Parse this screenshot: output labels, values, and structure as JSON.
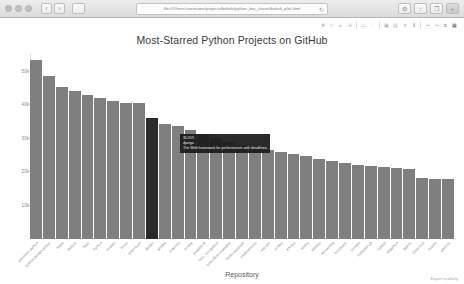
{
  "browser": {
    "url": "file:///Users/username/projects/bokeh/python_bar_charts/bokeh_plot.html",
    "reload_icon": "reload-icon",
    "back_icon": "‹",
    "forward_icon": "›",
    "sidebar_icon": "sidebar-icon",
    "settings_icon": "⚙",
    "share_icon": "↑",
    "tabs_icon": "❐",
    "newtab_icon": "+"
  },
  "toolbar": {
    "tools": [
      {
        "name": "pan-tool",
        "glyph": "✥"
      },
      {
        "name": "boxzoom-tool",
        "glyph": "□"
      },
      {
        "name": "wheelzoom-tool",
        "glyph": "⌕"
      },
      {
        "name": "crosshair-tool",
        "glyph": "✛"
      },
      {
        "name": "sep1",
        "glyph": "|"
      },
      {
        "name": "boxselect-tool",
        "glyph": "▭"
      },
      {
        "name": "lassoselect-tool",
        "glyph": "◌"
      },
      {
        "name": "sep2",
        "glyph": "|"
      },
      {
        "name": "tap-tool",
        "glyph": "▣"
      },
      {
        "name": "hover-tool",
        "glyph": "▤"
      },
      {
        "name": "reset-tool",
        "glyph": "✕"
      },
      {
        "name": "save-tool",
        "glyph": "⬇"
      },
      {
        "name": "sep3",
        "glyph": "|"
      },
      {
        "name": "undo-tool",
        "glyph": "↩"
      },
      {
        "name": "redo-tool",
        "glyph": "↪"
      },
      {
        "name": "menu-tool",
        "glyph": "≡"
      },
      {
        "name": "help-tool",
        "glyph": "▦"
      }
    ]
  },
  "export_label": "Export to plot.ly",
  "tooltip": {
    "visible": true,
    "stars": "35,919",
    "repository": "django",
    "description": "The Web framework for perfectionists with deadlines."
  },
  "chart_data": {
    "type": "bar",
    "title": "Most-Starred Python Projects on GitHub",
    "xlabel": "Repository",
    "ylabel": "Stars",
    "ylim": [
      0,
      55000
    ],
    "grid": false,
    "yticks": [
      "10k",
      "20k",
      "30k",
      "40k",
      "50k"
    ],
    "ytick_values": [
      10000,
      20000,
      30000,
      40000,
      50000
    ],
    "bar_color": "#7f7f7f",
    "highlight_color": "#2a2a2a",
    "highlight_index": 9,
    "categories": [
      "awesome-python",
      "system-design-primer",
      "httpie",
      "thefuck",
      "flask",
      "Python",
      "models",
      "keras",
      "scikit-learn",
      "django",
      "ansible",
      "requests",
      "scrapy",
      "youtube-dl",
      "face_recognition",
      "tensorflow-examples",
      "home-assistant",
      "shadowsocks",
      "you-get",
      "certbot",
      "XX-Net",
      "sentry",
      "pandas",
      "AiLearning",
      "localstack",
      "tornado",
      "HelloGitHub",
      "redash",
      "wtfpython",
      "pipenv",
      "Detectron",
      "manim",
      "glances"
    ],
    "values": [
      53100,
      48600,
      45200,
      44100,
      42900,
      42000,
      40900,
      40500,
      40300,
      35919,
      34100,
      33600,
      32400,
      31200,
      29900,
      28800,
      28000,
      27300,
      26500,
      25800,
      25200,
      24600,
      23900,
      23200,
      22600,
      22100,
      21800,
      21400,
      21100,
      20900,
      18200,
      17900,
      17700
    ]
  }
}
